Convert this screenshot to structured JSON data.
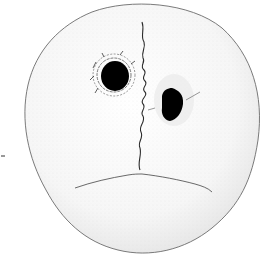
{
  "figure": {
    "colors": {
      "background": "#ffffff",
      "outline": "#6a6a6a",
      "stipple": "#c8c8c8",
      "hole": "#000000",
      "suture": "#2a2a2a"
    }
  }
}
